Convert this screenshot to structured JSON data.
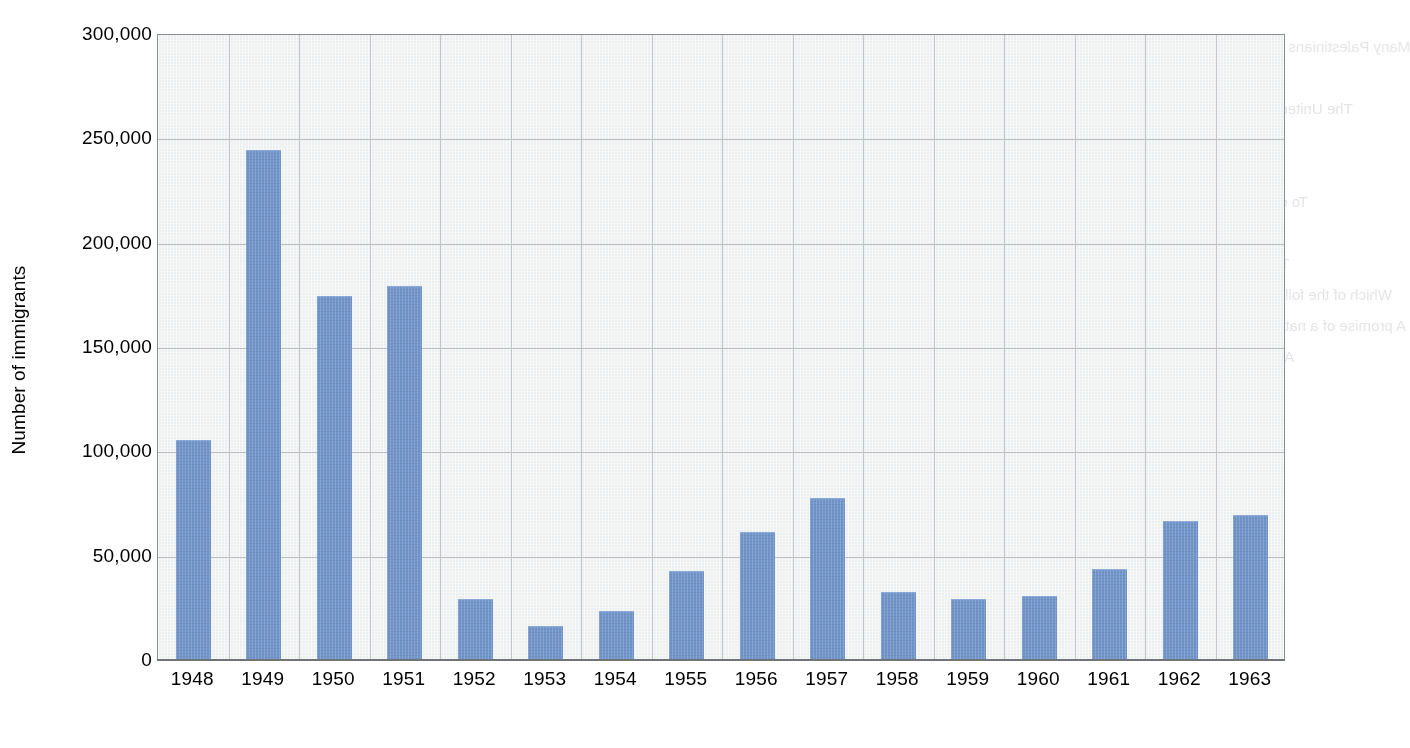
{
  "chart_data": {
    "type": "bar",
    "title": "",
    "subtitle": "",
    "xlabel": "",
    "ylabel": "Number of immigrants",
    "categories": [
      "1948",
      "1949",
      "1950",
      "1951",
      "1952",
      "1953",
      "1954",
      "1955",
      "1956",
      "1957",
      "1958",
      "1959",
      "1960",
      "1961",
      "1962",
      "1963"
    ],
    "values": [
      105000,
      244000,
      174000,
      179000,
      29000,
      16000,
      23000,
      42000,
      61000,
      77000,
      32000,
      29000,
      30000,
      43000,
      66000,
      69000
    ],
    "ylim": [
      0,
      300000
    ],
    "ytick_values": [
      0,
      50000,
      100000,
      150000,
      200000,
      250000,
      300000
    ],
    "ytick_labels": [
      "0",
      "50,000",
      "100,000",
      "150,000",
      "200,000",
      "250,000",
      "300,000"
    ],
    "grid": true,
    "grid_axis": "both",
    "legend": false,
    "legend_position": "none",
    "bar_color": "#7195c9",
    "plot_background": "#eceff0",
    "gridline_color": "#b9bdc0",
    "axis_color": "#6f7478",
    "series": [
      {
        "name": "Number of immigrants",
        "values": [
          105000,
          244000,
          174000,
          179000,
          29000,
          16000,
          23000,
          42000,
          61000,
          77000,
          32000,
          29000,
          30000,
          43000,
          66000,
          69000
        ]
      }
    ]
  },
  "ghost_text": {
    "note": "faint mirrored show-through text from the reverse side of the printed page",
    "lines": [
      "the Ottoman Empire.",
      "the Jewish state.",
      "or Jewish immigration.",
      "to remain neutral.",
      "Why were the Jewish people of Palestine prepared to use force?",
      "They believed that the Arabs would not agree to the terms of the UN",
      "resolution.",
      "They were sure that Britain would support their cause.",
      "They knew that they had no choice because their claim was weak.",
      "The Arab states were already preparing for war and so the Jews had",
      "to defend themselves.",
      "What was one of the outcomes of the 1948 Arab Israeli War?",
      "Israeli forces were pushed out of the land they had occupied.",
      "The Arab states won back some of the land given to Israel.",
      "Many Palestinians were forced to leave their homes and became",
      "refugees.",
      "The United Nations took control of the city of Jerusalem.",
      "Why was the Jewish Agency set up?",
      "To help Jewish people settle in Palestine.",
      "To organise Jewish resistance against the British.",
      "To raise money for the Zionist movement.",
      "To encourage Jewish immigration to Palestine.",
      "Which of the following best describes the Balfour Declaration?",
      "A promise of a national home for the Jewish people in Palestine.",
      "A statement of British support for an Arab state.",
      "An agreement between Britain and France.",
      "A United Nations resolution on partition."
    ]
  }
}
